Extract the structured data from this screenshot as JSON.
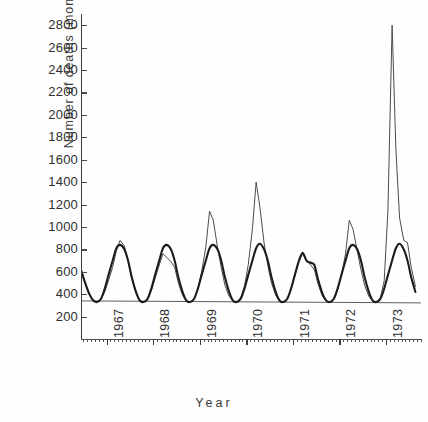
{
  "chart_data": {
    "type": "line",
    "title": "",
    "xlabel": "Year",
    "ylabel": "Number of deaths (monthly)",
    "ylim": [
      0,
      2900
    ],
    "yticks": [
      200,
      400,
      600,
      800,
      1000,
      1200,
      1400,
      1600,
      1800,
      2000,
      2200,
      2400,
      2600,
      2800
    ],
    "ytick_labels": [
      "200",
      "400",
      "600",
      "800",
      "1000",
      "1200",
      "1400",
      "1600",
      "1800",
      "2000",
      "2200",
      "2400",
      "2600",
      "2800"
    ],
    "xlim": [
      1966.45,
      1973.75
    ],
    "xticks": [
      1967,
      1968,
      1969,
      1970,
      1971,
      1972,
      1973
    ],
    "xtick_labels": [
      "1967",
      "1968",
      "1969",
      "1970",
      "1971",
      "1972",
      "1973"
    ],
    "grid": false,
    "legend": "none",
    "minor_xticks": "monthly",
    "baseline_value": 340,
    "annotations": [
      "Large epidemic spike reaching about 2800 deaths in early 1973",
      "Secondary observed peak of about 1400 deaths in early 1970",
      "Horizontal reference line drawn at roughly 340 deaths"
    ],
    "series": [
      {
        "name": "Observed monthly deaths",
        "style": "thin",
        "x": [
          1966.46,
          1966.54,
          1966.63,
          1966.71,
          1966.79,
          1966.88,
          1966.96,
          1967.04,
          1967.13,
          1967.21,
          1967.29,
          1967.38,
          1967.46,
          1967.54,
          1967.63,
          1967.71,
          1967.79,
          1967.88,
          1967.96,
          1968.04,
          1968.13,
          1968.21,
          1968.29,
          1968.38,
          1968.46,
          1968.54,
          1968.63,
          1968.71,
          1968.79,
          1968.88,
          1968.96,
          1969.04,
          1969.13,
          1969.21,
          1969.29,
          1969.38,
          1969.46,
          1969.54,
          1969.63,
          1969.71,
          1969.79,
          1969.88,
          1969.96,
          1970.04,
          1970.13,
          1970.21,
          1970.29,
          1970.38,
          1970.46,
          1970.54,
          1970.63,
          1970.71,
          1970.79,
          1970.88,
          1970.96,
          1971.04,
          1971.13,
          1971.21,
          1971.29,
          1971.38,
          1971.46,
          1971.54,
          1971.63,
          1971.71,
          1971.79,
          1971.88,
          1971.96,
          1972.04,
          1972.13,
          1972.21,
          1972.29,
          1972.38,
          1972.46,
          1972.54,
          1972.63,
          1972.71,
          1972.79,
          1972.88,
          1972.96,
          1973.04,
          1973.13,
          1973.21,
          1973.29,
          1973.38,
          1973.46,
          1973.54,
          1973.63
        ],
        "y": [
          620,
          500,
          400,
          345,
          330,
          355,
          420,
          520,
          640,
          790,
          880,
          830,
          700,
          540,
          410,
          345,
          330,
          350,
          430,
          540,
          660,
          760,
          730,
          690,
          640,
          500,
          390,
          340,
          330,
          360,
          450,
          600,
          820,
          1140,
          1060,
          820,
          640,
          480,
          380,
          340,
          330,
          370,
          470,
          660,
          980,
          1400,
          1180,
          860,
          660,
          500,
          390,
          340,
          330,
          360,
          440,
          560,
          690,
          760,
          700,
          660,
          620,
          490,
          385,
          340,
          330,
          355,
          440,
          570,
          760,
          1060,
          980,
          790,
          620,
          480,
          380,
          340,
          330,
          370,
          520,
          1150,
          2800,
          1700,
          1080,
          880,
          860,
          640,
          470
        ]
      },
      {
        "name": "Fitted / expected deaths",
        "style": "thick",
        "x": [
          1966.46,
          1966.54,
          1966.63,
          1966.71,
          1966.79,
          1966.88,
          1966.96,
          1967.04,
          1967.13,
          1967.21,
          1967.29,
          1967.38,
          1967.46,
          1967.54,
          1967.63,
          1967.71,
          1967.79,
          1967.88,
          1967.96,
          1968.04,
          1968.13,
          1968.21,
          1968.29,
          1968.38,
          1968.46,
          1968.54,
          1968.63,
          1968.71,
          1968.79,
          1968.88,
          1968.96,
          1969.04,
          1969.13,
          1969.21,
          1969.29,
          1969.38,
          1969.46,
          1969.54,
          1969.63,
          1969.71,
          1969.79,
          1969.88,
          1969.96,
          1970.04,
          1970.13,
          1970.21,
          1970.29,
          1970.38,
          1970.46,
          1970.54,
          1970.63,
          1970.71,
          1970.79,
          1970.88,
          1970.96,
          1971.04,
          1971.13,
          1971.21,
          1971.29,
          1971.38,
          1971.46,
          1971.54,
          1971.63,
          1971.71,
          1971.79,
          1971.88,
          1971.96,
          1972.04,
          1972.13,
          1972.21,
          1972.29,
          1972.38,
          1972.46,
          1972.54,
          1972.63,
          1972.71,
          1972.79,
          1972.88,
          1972.96,
          1973.04,
          1973.13,
          1973.21,
          1973.29,
          1973.38,
          1973.46,
          1973.54,
          1973.63
        ],
        "y": [
          600,
          500,
          400,
          345,
          330,
          360,
          450,
          570,
          700,
          810,
          840,
          800,
          700,
          550,
          420,
          345,
          330,
          360,
          450,
          570,
          700,
          810,
          840,
          800,
          700,
          550,
          420,
          345,
          330,
          360,
          450,
          570,
          700,
          810,
          840,
          800,
          700,
          550,
          420,
          345,
          330,
          360,
          450,
          570,
          700,
          810,
          850,
          800,
          700,
          550,
          420,
          345,
          330,
          360,
          450,
          570,
          700,
          770,
          700,
          680,
          660,
          530,
          410,
          345,
          330,
          360,
          450,
          570,
          700,
          810,
          840,
          800,
          700,
          550,
          420,
          345,
          330,
          360,
          450,
          570,
          700,
          810,
          850,
          800,
          700,
          550,
          420
        ]
      }
    ]
  }
}
